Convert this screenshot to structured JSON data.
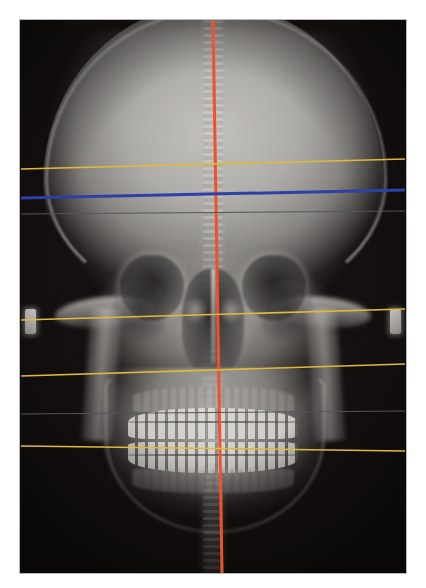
{
  "viewer": {
    "width": 426,
    "height": 588,
    "background_color": "#ffffff",
    "study_type": "PA cephalometric radiograph",
    "view_label": "Posteroanterior cephalogram with transverse analysis tracing"
  },
  "film": {
    "x": 20,
    "y": 20,
    "width": 386,
    "height": 553,
    "border_color": "#b9b9b9",
    "base_color": "#14100f"
  },
  "anatomy": {
    "regions": [
      {
        "name": "cranial-vault",
        "label": "Cranial vault"
      },
      {
        "name": "orbit-left",
        "label": "Left orbit"
      },
      {
        "name": "orbit-right",
        "label": "Right orbit"
      },
      {
        "name": "nasal-cavity",
        "label": "Nasal cavity"
      },
      {
        "name": "nasal-septum",
        "label": "Nasal septum"
      },
      {
        "name": "maxillary-sinus-left",
        "label": "Left maxillary sinus"
      },
      {
        "name": "maxillary-sinus-right",
        "label": "Right maxillary sinus"
      },
      {
        "name": "zygomatic-arch-left",
        "label": "Left zygomatic arch"
      },
      {
        "name": "zygomatic-arch-right",
        "label": "Right zygomatic arch"
      },
      {
        "name": "mandible",
        "label": "Mandible"
      },
      {
        "name": "ramus-left",
        "label": "Left mandibular ramus"
      },
      {
        "name": "ramus-right",
        "label": "Right mandibular ramus"
      },
      {
        "name": "maxillary-dentition",
        "label": "Maxillary dentition"
      },
      {
        "name": "mandibular-dentition",
        "label": "Mandibular dentition"
      },
      {
        "name": "orthodontic-archwire",
        "label": "Orthodontic archwire"
      },
      {
        "name": "cervical-spine",
        "label": "Cervical spine"
      },
      {
        "name": "ear-rod-marker-left",
        "label": "Left ear rod marker"
      },
      {
        "name": "ear-rod-marker-right",
        "label": "Right ear rod marker"
      }
    ]
  },
  "overlay": {
    "colors": {
      "midline": "#f0512c",
      "transverse": "#2f3fa8",
      "reference": "#e0b93c",
      "construction": "#555558"
    },
    "lines": [
      {
        "name": "midsagittal-midline",
        "label": "Midsagittal reference line",
        "color": "#f0512c",
        "orientation": "vertical",
        "width": 3,
        "x1": 213,
        "y1": 20,
        "x2": 222,
        "y2": 573
      },
      {
        "name": "supraorbital-reference-line",
        "label": "Supraorbital transverse reference",
        "color": "#e0b93c",
        "orientation": "horizontal",
        "width": 1.6,
        "x1": 21,
        "y1": 169,
        "x2": 405,
        "y2": 159
      },
      {
        "name": "orbital-transverse-line",
        "label": "Orbital transverse plane",
        "color": "#2f3fa8",
        "orientation": "horizontal",
        "width": 3,
        "x1": 21,
        "y1": 198,
        "x2": 405,
        "y2": 190
      },
      {
        "name": "zygomatic-reference-line",
        "label": "Zygomatic transverse reference",
        "color": "#e0b93c",
        "orientation": "horizontal",
        "width": 1.6,
        "x1": 21,
        "y1": 320,
        "x2": 405,
        "y2": 309
      },
      {
        "name": "maxillary-reference-line",
        "label": "Maxillary transverse reference",
        "color": "#e0b93c",
        "orientation": "horizontal",
        "width": 1.6,
        "x1": 21,
        "y1": 376,
        "x2": 405,
        "y2": 364
      },
      {
        "name": "occlusal-reference-line",
        "label": "Occlusal transverse reference",
        "color": "#e0b93c",
        "orientation": "horizontal",
        "width": 1.6,
        "x1": 21,
        "y1": 446,
        "x2": 405,
        "y2": 451
      },
      {
        "name": "upper-construction-line",
        "label": "Upper construction line",
        "color": "#555558",
        "orientation": "horizontal",
        "width": 1,
        "x1": 21,
        "y1": 214,
        "x2": 405,
        "y2": 211
      },
      {
        "name": "lower-construction-line",
        "label": "Lower construction line",
        "color": "#555558",
        "orientation": "horizontal",
        "width": 1,
        "x1": 21,
        "y1": 414,
        "x2": 405,
        "y2": 411
      }
    ]
  }
}
